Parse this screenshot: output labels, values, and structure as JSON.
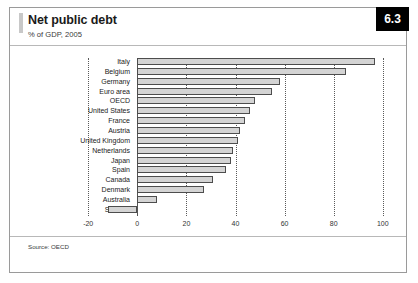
{
  "figure": {
    "title": "Net public debt",
    "subtitle": "% of GDP, 2005",
    "badge": "6.3",
    "source": "Source: OECD"
  },
  "chart_data": {
    "type": "bar",
    "orientation": "horizontal",
    "title": "Net public debt",
    "subtitle": "% of GDP, 2005",
    "xlabel": "",
    "ylabel": "",
    "xlim": [
      -20,
      100
    ],
    "xticks": [
      -20,
      0,
      20,
      40,
      60,
      80,
      100
    ],
    "xtick_labels": [
      "-20",
      "0",
      "20",
      "40",
      "60",
      "80",
      "100"
    ],
    "grid": true,
    "grid_axis": "x",
    "legend": false,
    "bar_fill": "#d4d4d4",
    "bar_edge": "#4d4d4d",
    "categories": [
      "Italy",
      "Belgium",
      "Germany",
      "Euro area",
      "OECD",
      "United States",
      "France",
      "Austria",
      "United Kingdom",
      "Netherlands",
      "Japan",
      "Spain",
      "Canada",
      "Denmark",
      "Australia",
      "Sweden"
    ],
    "values": [
      97,
      85,
      58,
      55,
      48,
      46,
      44,
      42,
      41,
      39,
      38,
      36,
      31,
      27,
      8,
      -12
    ]
  }
}
